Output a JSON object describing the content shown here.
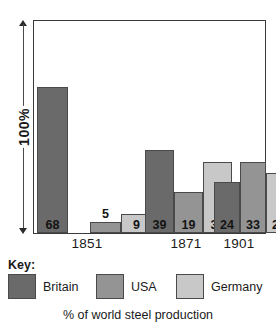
{
  "axis": {
    "label": "100%",
    "arrow_top_icon": "arrow-up-icon",
    "arrow_bottom_icon": "arrow-down-icon"
  },
  "key": {
    "title": "Key:"
  },
  "caption": "% of world steel production",
  "colors": {
    "britain": "#6a6a6a",
    "usa": "#949494",
    "germany": "#c8c8c8",
    "outline": "#4a4a4a",
    "frame": "#3a3a3a",
    "background": "#ffffff",
    "text": "#1a1a1a"
  },
  "chart_data": {
    "type": "bar",
    "title": "",
    "subtitle": "",
    "xlabel": "",
    "ylabel": "100%",
    "caption": "% of world steel production",
    "ylim": [
      0,
      100
    ],
    "grid": false,
    "legend_position": "bottom",
    "categories": [
      "1851",
      "1871",
      "1901"
    ],
    "series": [
      {
        "name": "Britain",
        "color": "#6a6a6a",
        "values": [
          68,
          39,
          24
        ]
      },
      {
        "name": "USA",
        "color": "#949494",
        "values": [
          5,
          19,
          33
        ]
      },
      {
        "name": "Germany",
        "color": "#c8c8c8",
        "values": [
          9,
          33,
          28
        ]
      }
    ],
    "bars": [
      {
        "group": "1851",
        "series": "Britain",
        "value": 68,
        "label": "68",
        "label_inside": true
      },
      {
        "group": "1851",
        "series": "USA",
        "value": 5,
        "label": "5",
        "label_inside": false
      },
      {
        "group": "1851",
        "series": "Germany",
        "value": 9,
        "label": "9",
        "label_inside": true
      },
      {
        "group": "1871",
        "series": "Britain",
        "value": 39,
        "label": "39",
        "label_inside": true
      },
      {
        "group": "1871",
        "series": "USA",
        "value": 19,
        "label": "19",
        "label_inside": true
      },
      {
        "group": "1871",
        "series": "Germany",
        "value": 33,
        "label": "33",
        "label_inside": true
      },
      {
        "group": "1901",
        "series": "Britain",
        "value": 24,
        "label": "24",
        "label_inside": true
      },
      {
        "group": "1901",
        "series": "USA",
        "value": 33,
        "label": "33",
        "label_inside": true
      },
      {
        "group": "1901",
        "series": "Germany",
        "value": 28,
        "label": "28",
        "label_inside": true
      }
    ]
  }
}
